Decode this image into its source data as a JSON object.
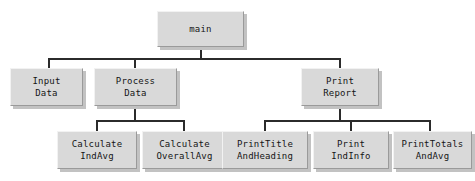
{
  "diagram": {
    "type": "structure-chart",
    "background_color": "#ffffff",
    "box_fill_color": "#d9d9d9",
    "box_shadow_color": "#c2c2c2",
    "line_color": "#2b2b2b",
    "text_color": "#151515"
  },
  "nodes": [
    {
      "id": "main",
      "label": "main",
      "lines": [
        "main"
      ],
      "level": 0,
      "x": 157,
      "y": 11,
      "w": 87,
      "h": 36
    },
    {
      "id": "input-data",
      "label": "Input Data",
      "lines": [
        "Input",
        "Data"
      ],
      "level": 1,
      "x": 10,
      "y": 68,
      "w": 73,
      "h": 38
    },
    {
      "id": "process-data",
      "label": "Process Data",
      "lines": [
        "Process",
        "Data"
      ],
      "level": 1,
      "x": 94,
      "y": 68,
      "w": 83,
      "h": 38
    },
    {
      "id": "print-report",
      "label": "Print Report",
      "lines": [
        "Print",
        "Report"
      ],
      "level": 1,
      "x": 301,
      "y": 68,
      "w": 78,
      "h": 38
    },
    {
      "id": "calculate-indavg",
      "label": "Calculate IndAvg",
      "lines": [
        "Calculate",
        "IndAvg"
      ],
      "level": 2,
      "x": 57,
      "y": 131,
      "w": 80,
      "h": 38
    },
    {
      "id": "calculate-overallavg",
      "label": "Calculate OverallAvg",
      "lines": [
        "Calculate",
        "OverallAvg"
      ],
      "level": 2,
      "x": 142,
      "y": 131,
      "w": 85,
      "h": 38
    },
    {
      "id": "print-title-and-heading",
      "label": "PrintTitle AndHeading",
      "lines": [
        "PrintTitle",
        "AndHeading"
      ],
      "level": 2,
      "x": 222,
      "y": 131,
      "w": 86,
      "h": 38
    },
    {
      "id": "print-indinfo",
      "label": "Print IndInfo",
      "lines": [
        "Print",
        "IndInfo"
      ],
      "level": 2,
      "x": 313,
      "y": 131,
      "w": 76,
      "h": 38
    },
    {
      "id": "print-totals-and-avg",
      "label": "PrintTotals AndAvg",
      "lines": [
        "PrintTotals",
        "AndAvg"
      ],
      "level": 2,
      "x": 393,
      "y": 131,
      "w": 79,
      "h": 38
    }
  ],
  "edges": [
    {
      "from": "main",
      "to": "input-data"
    },
    {
      "from": "main",
      "to": "process-data"
    },
    {
      "from": "main",
      "to": "print-report"
    },
    {
      "from": "process-data",
      "to": "calculate-indavg"
    },
    {
      "from": "process-data",
      "to": "calculate-overallavg"
    },
    {
      "from": "print-report",
      "to": "print-title-and-heading"
    },
    {
      "from": "print-report",
      "to": "print-indinfo"
    },
    {
      "from": "print-report",
      "to": "print-totals-and-avg"
    }
  ]
}
